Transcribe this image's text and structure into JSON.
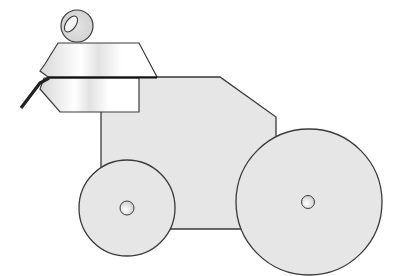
{
  "illustration": {
    "subject": "Line drawing of a wheeled robot/vehicle with a stacked trapezoidal head and a ball on top",
    "colors": {
      "background": "#ffffff",
      "body_fill": "#e6e6e6",
      "wheel_fill": "#e6e6e6",
      "outline": "#3a3a3a",
      "cable": "#222222",
      "head_fill_light": "#ffffff",
      "head_fill_shade": "#dcdcdc"
    },
    "parts": [
      {
        "name": "ball-top",
        "cx": 77,
        "cy": 25,
        "r": 16
      },
      {
        "name": "upper-head-plate"
      },
      {
        "name": "lower-head-plate"
      },
      {
        "name": "body"
      },
      {
        "name": "small-wheel",
        "cx": 127,
        "cy": 208,
        "r": 48
      },
      {
        "name": "large-wheel",
        "cx": 309,
        "cy": 202,
        "r": 73
      },
      {
        "name": "cable"
      }
    ]
  }
}
